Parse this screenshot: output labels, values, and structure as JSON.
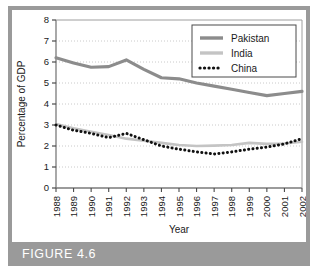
{
  "figure": {
    "caption": "FIGURE 4.6",
    "frame_color": "#9a9a9a",
    "banner_color": "#9a9a9a",
    "background": "#ffffff"
  },
  "chart_data": {
    "type": "line",
    "title": "",
    "xlabel": "Year",
    "ylabel": "Percentage of GDP",
    "categories": [
      "1988",
      "1989",
      "1990",
      "1991",
      "1992",
      "1993",
      "1994",
      "1995",
      "1996",
      "1997",
      "1998",
      "1999",
      "2000",
      "2001",
      "2002"
    ],
    "x": [
      1988,
      1989,
      1990,
      1991,
      1992,
      1993,
      1994,
      1995,
      1996,
      1997,
      1998,
      1999,
      2000,
      2001,
      2002
    ],
    "ylim": [
      0,
      8
    ],
    "yticks": [
      0,
      1,
      2,
      3,
      4,
      5,
      6,
      7,
      8
    ],
    "ytick_labels": [
      "0",
      "1",
      "2",
      "3",
      "4",
      "5",
      "6",
      "7",
      "8"
    ],
    "grid": "horizontal-dotted",
    "legend_position": "top-right",
    "series": [
      {
        "name": "Pakistan",
        "color": "#8c8c8c",
        "style": "solid",
        "width": 3.2,
        "values": [
          6.2,
          5.95,
          5.75,
          5.78,
          6.1,
          5.65,
          5.25,
          5.2,
          5.0,
          4.85,
          4.7,
          4.55,
          4.4,
          4.5,
          4.6
        ]
      },
      {
        "name": "India",
        "color": "#c4c4c4",
        "style": "solid",
        "width": 2.6,
        "values": [
          3.05,
          2.85,
          2.68,
          2.52,
          2.35,
          2.25,
          2.15,
          2.05,
          2.0,
          2.02,
          2.05,
          2.15,
          2.1,
          2.12,
          2.2
        ]
      },
      {
        "name": "China",
        "color": "#111111",
        "style": "dotted",
        "width": 3.0,
        "values": [
          3.0,
          2.75,
          2.6,
          2.4,
          2.6,
          2.3,
          2.0,
          1.85,
          1.72,
          1.62,
          1.72,
          1.85,
          1.95,
          2.1,
          2.35
        ]
      }
    ]
  },
  "legend": {
    "items": [
      {
        "label": "Pakistan",
        "color": "#8c8c8c",
        "style": "solid"
      },
      {
        "label": "India",
        "color": "#c4c4c4",
        "style": "solid"
      },
      {
        "label": "China",
        "color": "#111111",
        "style": "dotted"
      }
    ]
  }
}
